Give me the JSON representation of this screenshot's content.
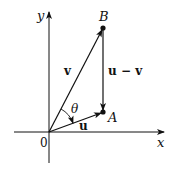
{
  "diagram": {
    "type": "vector-diagram",
    "axes": {
      "x_label": "x",
      "y_label": "y",
      "origin_label": "0"
    },
    "points": [
      {
        "name": "B",
        "label": "B"
      },
      {
        "name": "A",
        "label": "A"
      }
    ],
    "vectors": [
      {
        "name": "v",
        "label": "v",
        "from": "0",
        "to": "B"
      },
      {
        "name": "u",
        "label": "u",
        "from": "0",
        "to": "A"
      },
      {
        "name": "u-v",
        "label": "u − v",
        "from": "B",
        "to": "A"
      }
    ],
    "angle": {
      "label": "θ",
      "between": [
        "u",
        "v"
      ]
    }
  },
  "colors": {
    "stroke": "#111111",
    "background": "#ffffff"
  }
}
